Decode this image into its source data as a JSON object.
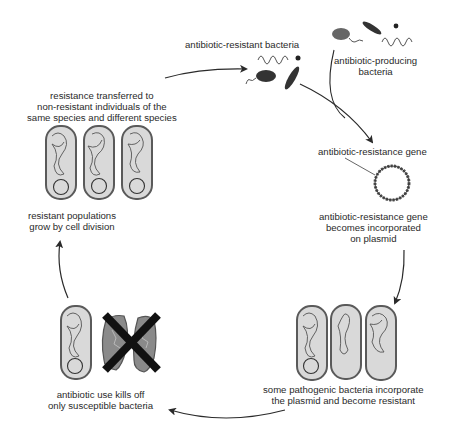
{
  "diagram": {
    "colors": {
      "background": "#ffffff",
      "ink": "#2a2a2a",
      "cell_fill": "#d9d9d9",
      "cell_outline": "#5a5a5a",
      "dead_cell_fill": "#8a8a8a",
      "x_mark": "#111111"
    },
    "labels": {
      "resistant_bacteria": "antibiotic-resistant bacteria",
      "producing_bacteria": [
        "antibiotic-producing",
        "bacteria"
      ],
      "resistance_gene": "antibiotic-resistance gene",
      "plasmid_incorporation": [
        "antibiotic-resistance gene",
        "becomes incorporated",
        "on plasmid"
      ],
      "pathogenic_incorporate": [
        "some pathogenic bacteria incorporate",
        "the plasmid and become resistant"
      ],
      "antibiotic_kills": [
        "antibiotic use kills off",
        "only susceptible bacteria"
      ],
      "populations_grow": [
        "resistant populations",
        "grow by cell division"
      ],
      "resistance_transferred": [
        "resistance transferred to",
        "non-resistant individuals of the",
        "same species and different species"
      ]
    },
    "stages": [
      {
        "id": "resistant-bacteria",
        "label_key": "resistant_bacteria"
      },
      {
        "id": "resistance-gene",
        "label_key": "resistance_gene"
      },
      {
        "id": "plasmid",
        "label_key": "plasmid_incorporation"
      },
      {
        "id": "pathogenic-resistant",
        "label_key": "pathogenic_incorporate"
      },
      {
        "id": "antibiotic-selection",
        "label_key": "antibiotic_kills"
      },
      {
        "id": "population-growth",
        "label_key": "populations_grow"
      },
      {
        "id": "horizontal-transfer",
        "label_key": "resistance_transferred"
      }
    ]
  }
}
